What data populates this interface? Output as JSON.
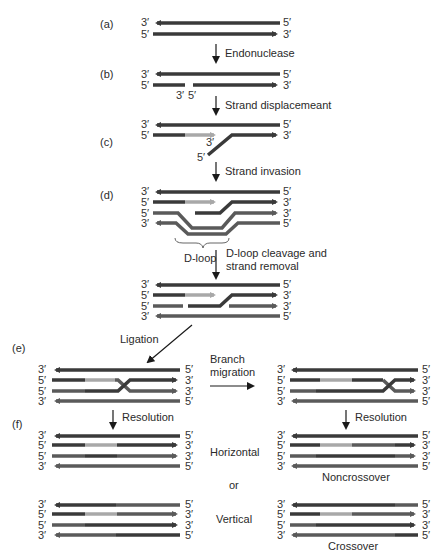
{
  "colors": {
    "dark_strand": "#3a3a3a",
    "mid_strand": "#5a5a5a",
    "light_strand": "#a8a8a8",
    "text": "#2a2a2a",
    "arrow": "#1a1a1a"
  },
  "panels": {
    "a": "(a)",
    "b": "(b)",
    "c": "(c)",
    "d": "(d)",
    "e": "(e)",
    "f": "(f)"
  },
  "steps": {
    "endonuclease": "Endonuclease",
    "strand_displacement": "Strand displacemeant",
    "strand_invasion": "Strand invasion",
    "dloop_cleavage_1": "D-loop cleavage and",
    "dloop_cleavage_2": "strand removal",
    "ligation": "Ligation",
    "branch_migration_1": "Branch",
    "branch_migration_2": "migration",
    "resolution_left": "Resolution",
    "resolution_right": "Resolution"
  },
  "labels": {
    "dloop": "D-loop",
    "horizontal": "Horizontal",
    "or": "or",
    "vertical": "Vertical",
    "noncrossover": "Noncrossover",
    "crossover": "Crossover"
  },
  "ends": {
    "three_prime": "3′",
    "five_prime": "5′"
  }
}
